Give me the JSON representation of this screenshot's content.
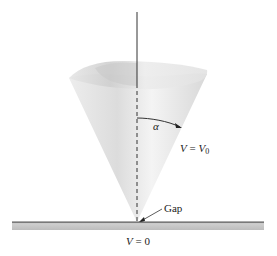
{
  "diagram": {
    "labels": {
      "angle": "α",
      "cone_potential_var": "V",
      "cone_potential_eq": " = ",
      "cone_potential_value": "V",
      "cone_potential_sub": "0",
      "gap": "Gap",
      "plane_potential_var": "V",
      "plane_potential_eq": " = ",
      "plane_potential_value": "0"
    },
    "colors": {
      "cone_light": "#f2f2f2",
      "cone_dark": "#cfcfcf",
      "axis": "#333333",
      "plate_fill": "#c8c8c8",
      "plate_edge": "#666666"
    }
  }
}
